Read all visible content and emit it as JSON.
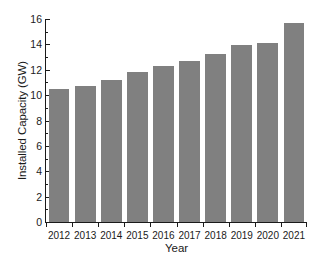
{
  "chart_data": {
    "type": "bar",
    "title": "",
    "subtitle": "",
    "xlabel": "Year",
    "ylabel": "Installed Capacity (GW)",
    "categories": [
      "2012",
      "2013",
      "2014",
      "2015",
      "2016",
      "2017",
      "2018",
      "2019",
      "2020",
      "2021"
    ],
    "values": [
      10.45,
      10.7,
      11.2,
      11.8,
      12.3,
      12.7,
      13.25,
      13.95,
      14.1,
      15.7
    ],
    "ylim": [
      0,
      16
    ],
    "ytick_labels": [
      "0",
      "2",
      "4",
      "6",
      "8",
      "10",
      "12",
      "14",
      "16"
    ],
    "ytick_values": [
      0,
      2,
      4,
      6,
      8,
      10,
      12,
      14,
      16
    ],
    "yminor_values": [
      1,
      3,
      5,
      7,
      9,
      11,
      13,
      15
    ],
    "grid": false,
    "legend": null,
    "legend_position": "none",
    "bar_color": "#808080",
    "axis_color": "#1a1a1a",
    "background": "#ffffff"
  }
}
